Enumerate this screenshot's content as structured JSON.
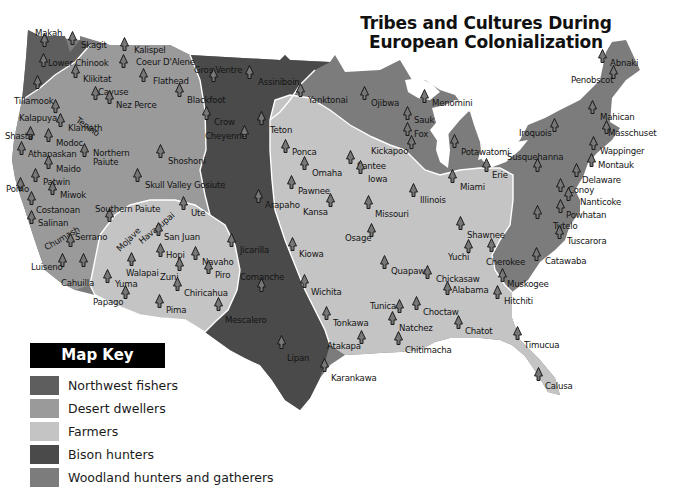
{
  "title": {
    "line1": "Tribes and Cultures During",
    "line2": "European Colonialization"
  },
  "colors": {
    "northwest_fishers": "#5e5e5e",
    "desert_dwellers": "#9a9a9a",
    "farmers": "#c4c4c4",
    "bison_hunters": "#4a4a4a",
    "woodland": "#7c7c7c",
    "marker": "#777777"
  },
  "legend": {
    "title": "Map Key",
    "items": [
      {
        "label": "Northwest fishers",
        "color": "#5e5e5e"
      },
      {
        "label": "Desert dwellers",
        "color": "#9a9a9a"
      },
      {
        "label": "Farmers",
        "color": "#c4c4c4"
      },
      {
        "label": "Bison hunters",
        "color": "#4a4a4a"
      },
      {
        "label": "Woodland hunters and gatherers",
        "color": "#7c7c7c"
      }
    ]
  },
  "tribes": [
    {
      "name": "Makah",
      "x": 35,
      "y": 28,
      "mx": 44,
      "my": 40
    },
    {
      "name": "Skagit",
      "x": 81,
      "y": 40,
      "mx": 72,
      "my": 38
    },
    {
      "name": "Lower Chinook",
      "x": 48,
      "y": 58,
      "mx": 43,
      "my": 60
    },
    {
      "name": "Kalispel",
      "x": 134,
      "y": 45,
      "mx": 124,
      "my": 44
    },
    {
      "name": "Coeur D'Alene",
      "x": 136,
      "y": 57,
      "mx": 123,
      "my": 61
    },
    {
      "name": "Klikitat",
      "x": 83,
      "y": 74,
      "mx": 75,
      "my": 71
    },
    {
      "name": "Flathead",
      "x": 153,
      "y": 76,
      "mx": 143,
      "my": 75
    },
    {
      "name": "Gros Ventre",
      "x": 194,
      "y": 65,
      "mx": 213,
      "my": 75
    },
    {
      "name": "Assiniboin",
      "x": 258,
      "y": 77,
      "mx": 249,
      "my": 72
    },
    {
      "name": "Cayuse",
      "x": 98,
      "y": 87,
      "mx": 95,
      "my": 93
    },
    {
      "name": "Nez Perce",
      "x": 116,
      "y": 100,
      "mx": 109,
      "my": 97
    },
    {
      "name": "Tillamook",
      "x": 14,
      "y": 96,
      "mx": 37,
      "my": 82
    },
    {
      "name": "Blackfoot",
      "x": 187,
      "y": 95,
      "mx": 179,
      "my": 90
    },
    {
      "name": "Crow",
      "x": 214,
      "y": 117,
      "mx": 206,
      "my": 113
    },
    {
      "name": "Yanktonai",
      "x": 308,
      "y": 95,
      "mx": 300,
      "my": 90
    },
    {
      "name": "Ojibwa",
      "x": 371,
      "y": 98,
      "mx": 364,
      "my": 93
    },
    {
      "name": "Menomini",
      "x": 432,
      "y": 98,
      "mx": 424,
      "my": 96
    },
    {
      "name": "Sauk",
      "x": 414,
      "y": 115,
      "mx": 407,
      "my": 113
    },
    {
      "name": "Fox",
      "x": 414,
      "y": 129,
      "mx": 407,
      "my": 129
    },
    {
      "name": "Kickapoo",
      "x": 371,
      "y": 146,
      "mx": 411,
      "my": 142
    },
    {
      "name": "Potawatomi",
      "x": 461,
      "y": 147,
      "mx": 454,
      "my": 141
    },
    {
      "name": "Kalapuya",
      "x": 19,
      "y": 113,
      "mx": 55,
      "my": 106
    },
    {
      "name": "Tenino",
      "x": 77,
      "y": 114,
      "mx": 0,
      "my": 0,
      "rotate": 35
    },
    {
      "name": "Klamath",
      "x": 68,
      "y": 123,
      "mx": 60,
      "my": 120
    },
    {
      "name": "Shasta",
      "x": 5,
      "y": 131,
      "mx": 30,
      "my": 133
    },
    {
      "name": "Modoc",
      "x": 56,
      "y": 138,
      "mx": 48,
      "my": 135
    },
    {
      "name": "Athapaskan",
      "x": 28,
      "y": 149,
      "mx": 21,
      "my": 148
    },
    {
      "name": "Northern",
      "x": 93,
      "y": 148,
      "mx": 84,
      "my": 150
    },
    {
      "name": "Paiute",
      "x": 93,
      "y": 157,
      "mx": 0,
      "my": 0
    },
    {
      "name": "Shoshoni",
      "x": 168,
      "y": 156,
      "mx": 160,
      "my": 151
    },
    {
      "name": "Cheyenne",
      "x": 205,
      "y": 131,
      "mx": 244,
      "my": 132
    },
    {
      "name": "Teton",
      "x": 270,
      "y": 125,
      "mx": 261,
      "my": 118
    },
    {
      "name": "Santee",
      "x": 357,
      "y": 161,
      "mx": 350,
      "my": 157
    },
    {
      "name": "Ponca",
      "x": 292,
      "y": 147,
      "mx": 285,
      "my": 146
    },
    {
      "name": "Omaha",
      "x": 312,
      "y": 168,
      "mx": 304,
      "my": 163
    },
    {
      "name": "Iowa",
      "x": 368,
      "y": 174,
      "mx": 360,
      "my": 167
    },
    {
      "name": "Pawnee",
      "x": 298,
      "y": 186,
      "mx": 291,
      "my": 182
    },
    {
      "name": "Maido",
      "x": 56,
      "y": 164,
      "mx": 48,
      "my": 162
    },
    {
      "name": "Patwin",
      "x": 43,
      "y": 177,
      "mx": 35,
      "my": 175
    },
    {
      "name": "Pomo",
      "x": 6,
      "y": 184,
      "mx": 20,
      "my": 184
    },
    {
      "name": "Miwok",
      "x": 60,
      "y": 190,
      "mx": 52,
      "my": 188
    },
    {
      "name": "Skull Valley Gosiute",
      "x": 145,
      "y": 180,
      "mx": 137,
      "my": 175
    },
    {
      "name": "Illinois",
      "x": 420,
      "y": 195,
      "mx": 413,
      "my": 190
    },
    {
      "name": "Miami",
      "x": 460,
      "y": 182,
      "mx": 452,
      "my": 176
    },
    {
      "name": "Erie",
      "x": 492,
      "y": 170,
      "mx": 486,
      "my": 165
    },
    {
      "name": "Costanoan",
      "x": 36,
      "y": 205,
      "mx": 31,
      "my": 198
    },
    {
      "name": "Southern Paiute",
      "x": 95,
      "y": 204,
      "mx": 109,
      "my": 215
    },
    {
      "name": "Ute",
      "x": 191,
      "y": 208,
      "mx": 183,
      "my": 203
    },
    {
      "name": "Arapaho",
      "x": 265,
      "y": 200,
      "mx": 258,
      "my": 196
    },
    {
      "name": "Kansa",
      "x": 303,
      "y": 207,
      "mx": 330,
      "my": 200
    },
    {
      "name": "Missouri",
      "x": 375,
      "y": 209,
      "mx": 368,
      "my": 202
    },
    {
      "name": "Salinan",
      "x": 38,
      "y": 218,
      "mx": 31,
      "my": 217
    },
    {
      "name": "Osage",
      "x": 345,
      "y": 233,
      "mx": 371,
      "my": 230
    },
    {
      "name": "Shawnee",
      "x": 467,
      "y": 230,
      "mx": 460,
      "my": 223
    },
    {
      "name": "Chumash",
      "x": 45,
      "y": 243,
      "mx": 0,
      "my": 0,
      "rotate": -30
    },
    {
      "name": "Serrano",
      "x": 75,
      "y": 232,
      "mx": 70,
      "my": 240
    },
    {
      "name": "Mojave",
      "x": 118,
      "y": 245,
      "mx": 0,
      "my": 0,
      "rotate": -45
    },
    {
      "name": "Havasupai",
      "x": 140,
      "y": 237,
      "mx": 0,
      "my": 0,
      "rotate": -40
    },
    {
      "name": "San Juan",
      "x": 164,
      "y": 232,
      "mx": 158,
      "my": 229
    },
    {
      "name": "Jicarilla",
      "x": 240,
      "y": 245,
      "mx": 231,
      "my": 240
    },
    {
      "name": "Kiowa",
      "x": 299,
      "y": 249,
      "mx": 292,
      "my": 244
    },
    {
      "name": "Yuchi",
      "x": 448,
      "y": 252,
      "mx": 468,
      "my": 246
    },
    {
      "name": "Cherokee",
      "x": 486,
      "y": 257,
      "mx": 491,
      "my": 245
    },
    {
      "name": "Catawaba",
      "x": 545,
      "y": 256,
      "mx": 536,
      "my": 254
    },
    {
      "name": "Luiseno",
      "x": 31,
      "y": 262,
      "mx": 62,
      "my": 260
    },
    {
      "name": "Hopi",
      "x": 166,
      "y": 250,
      "mx": 160,
      "my": 250
    },
    {
      "name": "Navaho",
      "x": 202,
      "y": 257,
      "mx": 195,
      "my": 253
    },
    {
      "name": "Walapai",
      "x": 126,
      "y": 268,
      "mx": 131,
      "my": 259
    },
    {
      "name": "Cahuilla",
      "x": 61,
      "y": 278,
      "mx": 83,
      "my": 260
    },
    {
      "name": "Zuni",
      "x": 160,
      "y": 272,
      "mx": 179,
      "my": 264
    },
    {
      "name": "Piro",
      "x": 215,
      "y": 270,
      "mx": 208,
      "my": 267
    },
    {
      "name": "Comanche",
      "x": 240,
      "y": 272,
      "mx": 261,
      "my": 285
    },
    {
      "name": "Wichita",
      "x": 311,
      "y": 287,
      "mx": 304,
      "my": 281
    },
    {
      "name": "Quapaw",
      "x": 391,
      "y": 266,
      "mx": 384,
      "my": 262
    },
    {
      "name": "Chickasaw",
      "x": 436,
      "y": 274,
      "mx": 427,
      "my": 272
    },
    {
      "name": "Alabama",
      "x": 452,
      "y": 285,
      "mx": 447,
      "my": 288
    },
    {
      "name": "Muskogee",
      "x": 507,
      "y": 279,
      "mx": 502,
      "my": 275
    },
    {
      "name": "Hitchiti",
      "x": 504,
      "y": 296,
      "mx": 497,
      "my": 292
    },
    {
      "name": "Yuma",
      "x": 115,
      "y": 279,
      "mx": 107,
      "my": 276
    },
    {
      "name": "Chiricahua",
      "x": 184,
      "y": 288,
      "mx": 177,
      "my": 284
    },
    {
      "name": "Papago",
      "x": 93,
      "y": 297,
      "mx": 125,
      "my": 292
    },
    {
      "name": "Pima",
      "x": 166,
      "y": 305,
      "mx": 159,
      "my": 301
    },
    {
      "name": "Mescalero",
      "x": 225,
      "y": 315,
      "mx": 218,
      "my": 304
    },
    {
      "name": "Tunica",
      "x": 370,
      "y": 301,
      "mx": 399,
      "my": 306
    },
    {
      "name": "Choctaw",
      "x": 423,
      "y": 307,
      "mx": 416,
      "my": 303
    },
    {
      "name": "Tonkawa",
      "x": 333,
      "y": 318,
      "mx": 326,
      "my": 313
    },
    {
      "name": "Natchez",
      "x": 399,
      "y": 323,
      "mx": 392,
      "my": 318
    },
    {
      "name": "Chatot",
      "x": 465,
      "y": 326,
      "mx": 458,
      "my": 322
    },
    {
      "name": "Atakapa",
      "x": 327,
      "y": 341,
      "mx": 361,
      "my": 337
    },
    {
      "name": "Chitimacha",
      "x": 405,
      "y": 345,
      "mx": 398,
      "my": 338
    },
    {
      "name": "Timucua",
      "x": 524,
      "y": 340,
      "mx": 517,
      "my": 333
    },
    {
      "name": "Lipan",
      "x": 287,
      "y": 353,
      "mx": 281,
      "my": 342
    },
    {
      "name": "Karankawa",
      "x": 331,
      "y": 373,
      "mx": 324,
      "my": 365
    },
    {
      "name": "Calusa",
      "x": 545,
      "y": 381,
      "mx": 538,
      "my": 374
    },
    {
      "name": "Abnaki",
      "x": 610,
      "y": 58,
      "mx": 602,
      "my": 56
    },
    {
      "name": "Penobscot",
      "x": 571,
      "y": 75,
      "mx": 613,
      "my": 72
    },
    {
      "name": "Mahican",
      "x": 600,
      "y": 112,
      "mx": 592,
      "my": 107
    },
    {
      "name": "Iroquois",
      "x": 519,
      "y": 128,
      "mx": 554,
      "my": 125
    },
    {
      "name": "Masschuset",
      "x": 608,
      "y": 128,
      "mx": 606,
      "my": 127
    },
    {
      "name": "Susquehanna",
      "x": 507,
      "y": 152,
      "mx": 537,
      "my": 165
    },
    {
      "name": "Wappinger",
      "x": 600,
      "y": 146,
      "mx": 593,
      "my": 143
    },
    {
      "name": "Montauk",
      "x": 598,
      "y": 160,
      "mx": 591,
      "my": 160
    },
    {
      "name": "Delaware",
      "x": 582,
      "y": 175,
      "mx": 576,
      "my": 170
    },
    {
      "name": "Conoy",
      "x": 568,
      "y": 185,
      "mx": 560,
      "my": 185
    },
    {
      "name": "Nanticoke",
      "x": 580,
      "y": 197,
      "mx": 568,
      "my": 194
    },
    {
      "name": "Powhatan",
      "x": 566,
      "y": 210,
      "mx": 560,
      "my": 206
    },
    {
      "name": "Tutelo",
      "x": 553,
      "y": 221,
      "mx": 537,
      "my": 212
    },
    {
      "name": "Tuscarora",
      "x": 567,
      "y": 236,
      "mx": 559,
      "my": 232
    }
  ]
}
